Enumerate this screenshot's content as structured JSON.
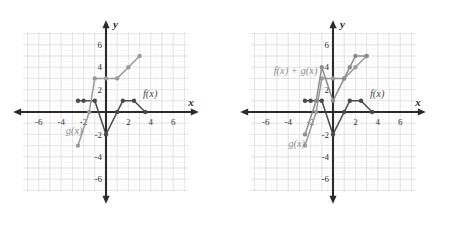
{
  "figure": {
    "colors": {
      "grid": "#e3e0e0",
      "grid_major": "#d2cfcf",
      "axis": "#2b2b2b",
      "f_curve": "#4a4a4a",
      "g_curve": "#9a9a9a",
      "sum_curve": "#8d8d8d",
      "tick_text": "#333333",
      "background": "#ffffff"
    }
  },
  "axes": {
    "x_label": "x",
    "y_label": "y",
    "x_ticks": [
      "-6",
      "-4",
      "-2",
      "2",
      "4",
      "6"
    ],
    "y_ticks": [
      "6",
      "4",
      "2",
      "-2",
      "-4",
      "-6"
    ],
    "x_tick_values": [
      -6,
      -4,
      -2,
      2,
      4,
      6
    ],
    "y_tick_values": [
      6,
      4,
      2,
      -2,
      -4,
      -6
    ],
    "xlim": [
      -8,
      8
    ],
    "ylim": [
      -8,
      8
    ],
    "grid": true
  },
  "panels": [
    {
      "id": "left-panel",
      "name": "graph-f-and-g",
      "labels": [
        {
          "text": "f(x)",
          "x": 3.3,
          "y": 1.35,
          "name": "f-label"
        },
        {
          "text": "g(x)",
          "x": -3.6,
          "y": -2.0,
          "name": "g-label"
        }
      ],
      "curves": [
        {
          "name": "f(x)",
          "style": "f",
          "points": [
            [
              -2.5,
              1
            ],
            [
              -2,
              1
            ],
            [
              -1,
              1
            ],
            [
              0,
              -2
            ],
            [
              1,
              0
            ],
            [
              1.5,
              1
            ],
            [
              2.5,
              1
            ],
            [
              3.5,
              0
            ]
          ]
        },
        {
          "name": "g(x)",
          "style": "g",
          "points": [
            [
              -2.5,
              -3
            ],
            [
              -1.5,
              0
            ],
            [
              -1,
              3
            ],
            [
              0,
              3
            ],
            [
              1,
              3
            ],
            [
              2,
              4
            ],
            [
              3,
              5
            ]
          ]
        }
      ]
    },
    {
      "id": "right-panel",
      "name": "graph-f-plus-g",
      "labels": [
        {
          "text": "f(x) + g(x)",
          "x": -5.3,
          "y": 3.4,
          "name": "sum-label"
        },
        {
          "text": "f(x)",
          "x": 3.3,
          "y": 1.35,
          "name": "f-label"
        },
        {
          "text": "g(x)",
          "x": -4.0,
          "y": -3.1,
          "name": "g-label"
        }
      ],
      "curves": [
        {
          "name": "f(x)",
          "style": "f",
          "points": [
            [
              -2.5,
              1
            ],
            [
              -2,
              1
            ],
            [
              -1,
              1
            ],
            [
              0,
              -2
            ],
            [
              1,
              0
            ],
            [
              1.5,
              1
            ],
            [
              2.5,
              1
            ],
            [
              3.5,
              0
            ]
          ]
        },
        {
          "name": "g(x)",
          "style": "g",
          "points": [
            [
              -2.5,
              -3
            ],
            [
              -1.5,
              0
            ],
            [
              -1,
              3
            ],
            [
              0,
              3
            ],
            [
              1,
              3
            ],
            [
              2,
              4
            ],
            [
              3,
              5
            ]
          ]
        },
        {
          "name": "f(x) + g(x)",
          "style": "sum",
          "points": [
            [
              -2.5,
              -2
            ],
            [
              -1.5,
              1
            ],
            [
              -1,
              4
            ],
            [
              0,
              1
            ],
            [
              1,
              3
            ],
            [
              1.5,
              4
            ],
            [
              2,
              5
            ],
            [
              3,
              5
            ]
          ]
        }
      ]
    }
  ],
  "chart_data": {
    "type": "line",
    "xlabel": "x",
    "ylabel": "y",
    "xlim": [
      -8,
      8
    ],
    "ylim": [
      -8,
      8
    ],
    "grid": true,
    "legend": "inline-annotations",
    "panels": [
      {
        "panel": "left",
        "series": [
          {
            "name": "f(x)",
            "x": [
              -2.5,
              -2,
              -1,
              0,
              1,
              1.5,
              2.5,
              3.5
            ],
            "y": [
              1,
              1,
              1,
              -2,
              0,
              1,
              1,
              0
            ]
          },
          {
            "name": "g(x)",
            "x": [
              -2.5,
              -1.5,
              -1,
              0,
              1,
              2,
              3
            ],
            "y": [
              -3,
              0,
              3,
              3,
              3,
              4,
              5
            ]
          }
        ]
      },
      {
        "panel": "right",
        "series": [
          {
            "name": "f(x)",
            "x": [
              -2.5,
              -2,
              -1,
              0,
              1,
              1.5,
              2.5,
              3.5
            ],
            "y": [
              1,
              1,
              1,
              -2,
              0,
              1,
              1,
              0
            ]
          },
          {
            "name": "g(x)",
            "x": [
              -2.5,
              -1.5,
              -1,
              0,
              1,
              2,
              3
            ],
            "y": [
              -3,
              0,
              3,
              3,
              3,
              4,
              5
            ]
          },
          {
            "name": "f(x) + g(x)",
            "x": [
              -2.5,
              -1.5,
              -1,
              0,
              1,
              1.5,
              2,
              3
            ],
            "y": [
              -2,
              1,
              4,
              1,
              3,
              4,
              5,
              5
            ]
          }
        ]
      }
    ]
  }
}
